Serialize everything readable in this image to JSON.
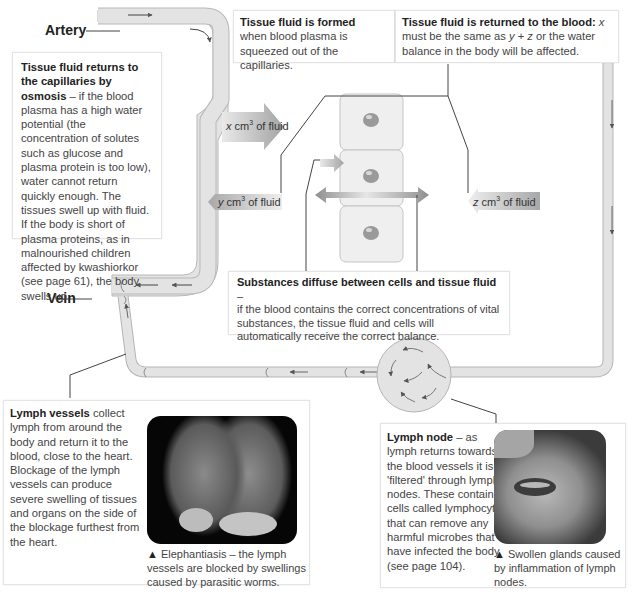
{
  "labels": {
    "artery": "Artery",
    "vein": "Vein"
  },
  "fluid_arrows": {
    "x": {
      "var": "x",
      "unit": " cm",
      "sup": "3",
      "rest": " of fluid"
    },
    "y": {
      "var": "y",
      "unit": " cm",
      "sup": "3",
      "rest": " of fluid"
    },
    "z": {
      "var": "z",
      "unit": " cm",
      "sup": "3",
      "rest": " of fluid"
    }
  },
  "boxes": {
    "osmosis": {
      "title": "Tissue fluid returns to the capillaries by osmosis",
      "body": " – if the blood plasma has a high water potential (the concentration of solutes such as glucose and plasma protein is too low), water cannot return quickly enough. The tissues swell up with fluid. If the body is short of plasma proteins, as in malnourished children affected by kwashiorkor (see page 61), the body swells up."
    },
    "formed": {
      "title": "Tissue fluid is formed",
      "body": "when blood plasma is squeezed out of the capillaries."
    },
    "returned": {
      "title": "Tissue fluid is returned to the blood:",
      "body_pre": " ",
      "x": "x",
      "mid1": " must be the same as ",
      "y": "y",
      "plus": " + ",
      "z": "z",
      "body_post": " or the water balance in the body will be affected."
    },
    "diffuse": {
      "title": "Substances diffuse between cells and tissue fluid",
      "dash": " –",
      "body": "if the blood contains the correct concentrations of vital substances, the tissue fluid and cells will automatically receive the correct balance."
    },
    "lymph_vessels": {
      "title": "Lymph vessels",
      "body": " collect lymph from around the body and return it to the blood, close to the heart. Blockage of the lymph vessels can produce severe swelling of tissues and organs on the side of the blockage furthest from the heart.",
      "caption_marker": "▲",
      "caption": " Elephantiasis – the lymph vessels are blocked by swellings caused by parasitic worms."
    },
    "lymph_node": {
      "title": "Lymph node",
      "body": " – as lymph returns towards the blood vessels it is 'filtered' through lymph nodes. These contain cells called lymphocytes that can remove any harmful microbes that have infected the body (see page 104).",
      "caption_marker": "▲",
      "caption": " Swollen glands caused by inflammation of lymph nodes."
    }
  },
  "colors": {
    "vessel_fill": "#e3e3e3",
    "vessel_stroke": "#b5b5b5",
    "arrow_fill": "#a8a8a8",
    "cell_fill": "#efefef",
    "nucleus": "#9a9a9a",
    "line": "#444444"
  }
}
